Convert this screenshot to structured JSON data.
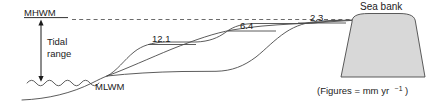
{
  "figure": {
    "kind": "cross-section-diagram",
    "background_color": "#ffffff",
    "line_color": "#4a4a4a",
    "text_color": "#1b1b1b",
    "bank_fill_color": "#d8d8d8"
  },
  "levels": {
    "high_water": {
      "label": "MHWM",
      "underlined": true,
      "dashed_line": true
    },
    "low_water": {
      "label": "MLWM",
      "underlined": false
    }
  },
  "tidal_range": {
    "label_line1": "Tidal",
    "label_line2": "range",
    "arrow": "double-headed-vertical"
  },
  "accretion_labels": [
    {
      "value": "12.1",
      "terrace": "lower"
    },
    {
      "value": "6.4",
      "terrace": "middle"
    },
    {
      "value": "2.3",
      "terrace": "upper"
    }
  ],
  "sea_bank": {
    "label": "Sea bank"
  },
  "caption": {
    "text": "(Figures = mm yr",
    "superscript": "−1",
    "closing": ")",
    "full": "(Figures = mm yr −1)"
  }
}
